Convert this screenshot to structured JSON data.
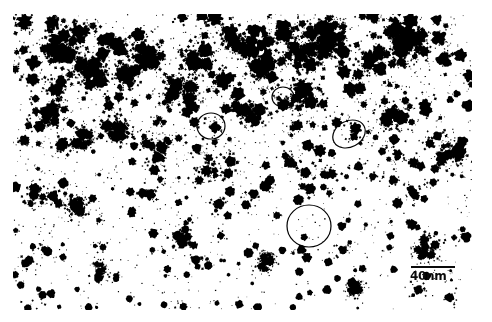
{
  "image": {
    "title": "Nanoparticle electron micrograph",
    "kind": "binary-thresholded-electron-micrograph",
    "width": 492,
    "height": 322,
    "background_color": "#ffffff",
    "particle_color": "#000000",
    "margins": {
      "left": 13,
      "top": 14,
      "right": 20,
      "bottom": 12
    }
  },
  "scale_bar": {
    "label": "40nm",
    "value": 40,
    "unit": "nm",
    "bar_length_px": 44,
    "x": 409,
    "y": 266,
    "color": "#0a0a0a"
  },
  "annotations": {
    "stroke_color": "#000000",
    "stroke_width": 1.2,
    "items": [
      {
        "name": "circle-annotation-1",
        "shape": "circle",
        "cx": 211,
        "cy": 126,
        "rx": 14,
        "ry": 13,
        "rotation": 0
      },
      {
        "name": "circle-annotation-2",
        "shape": "circle",
        "cx": 283,
        "cy": 97,
        "rx": 11,
        "ry": 10,
        "rotation": 0
      },
      {
        "name": "circle-annotation-3",
        "shape": "ellipse",
        "cx": 349,
        "cy": 134,
        "rx": 17,
        "ry": 13,
        "rotation": -28
      },
      {
        "name": "circle-annotation-4",
        "shape": "circle",
        "cx": 309,
        "cy": 226,
        "rx": 22,
        "ry": 21,
        "rotation": 0
      }
    ]
  },
  "particles": {
    "description": "Dark irregular nanoparticle blobs with splatter/fractal edges on a white field; denser and more aggregated in the upper-left and upper-middle, sparser and rounder toward the lower half.",
    "count_approx": 520,
    "density_note": "upper-left aggregated clusters; lower region discrete round particles",
    "seed": 20240517
  }
}
